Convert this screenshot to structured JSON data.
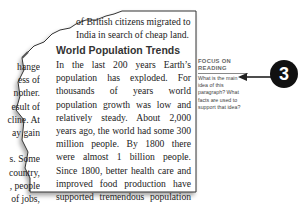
{
  "top_fragment": {
    "line1": "of British citizens migrated to",
    "line2": "India in search of cheap land."
  },
  "left_fragments": [
    "hange",
    "ess of",
    "nother.",
    "esult of",
    "cline. At",
    "ay gain",
    "",
    "s. Some",
    "country,",
    ", people",
    " of jobs,",
    "ommon"
  ],
  "section": {
    "heading": "World Population Trends",
    "paragraph1": "In the last 200 years Earth’s population has exploded. For thousands of years world population growth was low and relatively steady. About 2,000 years ago, the world had some 300 million people. By 1800 there were almost 1 billion people. Since 1800, better health care and improved food production have supported tremendous population growth. In 1999 the world’s population passed 6 billion people.",
    "paragraph2": "Population trends are an important part of the study of the world’s people. Two important population trends are clear"
  },
  "sidebar": {
    "title_line1": "Focus on",
    "title_line2": "Reading",
    "question": "What is the main idea of this paragraph? What facts are used to support that idea?"
  },
  "callout": {
    "number": "3"
  }
}
